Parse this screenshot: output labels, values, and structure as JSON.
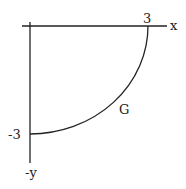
{
  "diagram": {
    "axes": {
      "x_label": "x",
      "y_label": "-y",
      "x_tick": "3",
      "y_tick": "-3"
    },
    "curve": {
      "label": "G",
      "description": "quarter circle arc from (3,0) to (0,-3)"
    },
    "colors": {
      "stroke": "#222222",
      "background": "#ffffff"
    }
  }
}
